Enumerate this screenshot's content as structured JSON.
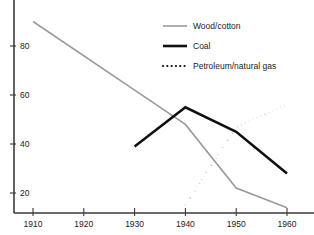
{
  "chart_data": {
    "type": "line",
    "title": "",
    "subtitle": "",
    "xlabel": "",
    "ylabel": "",
    "xlim": [
      1905,
      1963
    ],
    "ylim": [
      10,
      92
    ],
    "xticks": [
      1910,
      1920,
      1930,
      1940,
      1950,
      1960
    ],
    "xtick_labels": [
      "1910",
      "1920",
      "1930",
      "1940",
      "1950",
      "1960"
    ],
    "yticks": [
      20,
      40,
      60,
      80
    ],
    "ytick_labels": [
      "20",
      "40",
      "60",
      "80"
    ],
    "grid": false,
    "legend_position": "top-center-right",
    "series": [
      {
        "name": "Wood/cotton",
        "style": "solid",
        "color": "#9a9a9a",
        "width": 1.6,
        "x": [
          1910,
          1930,
          1940,
          1950,
          1960
        ],
        "values": [
          90,
          62,
          48,
          22,
          14
        ]
      },
      {
        "name": "Coal",
        "style": "solid",
        "color": "#111111",
        "width": 2.6,
        "x": [
          1930,
          1940,
          1950,
          1960
        ],
        "values": [
          39,
          55,
          45,
          28
        ]
      },
      {
        "name": "Petroleum/natural gas",
        "style": "dotted",
        "color": "#111111",
        "width": 2.2,
        "x": [
          1940,
          1950,
          1960
        ],
        "values": [
          15,
          47,
          56
        ]
      }
    ]
  },
  "legend": {
    "items": [
      {
        "label": "Wood/cotton"
      },
      {
        "label": "Coal"
      },
      {
        "label": "Petroleum/natural gas"
      }
    ]
  },
  "axes": {
    "x_tick_labels": [
      "1910",
      "1920",
      "1930",
      "1940",
      "1950",
      "1960"
    ],
    "y_tick_labels": [
      "20",
      "40",
      "60",
      "80"
    ]
  }
}
